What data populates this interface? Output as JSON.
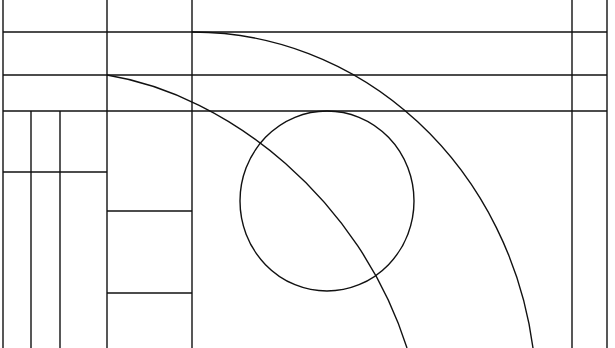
{
  "figure": {
    "size": {
      "width": 615,
      "height": 348
    },
    "stroke_color": "#111111",
    "background": "#ffffff",
    "vertical_lines": [
      {
        "x": 3,
        "y1": 0,
        "y2": 348
      },
      {
        "x": 107,
        "y1": 0,
        "y2": 348
      },
      {
        "x": 192,
        "y1": 0,
        "y2": 348
      },
      {
        "x": 572,
        "y1": 0,
        "y2": 348
      },
      {
        "x": 607,
        "y1": 0,
        "y2": 348
      },
      {
        "x": 31,
        "y1": 111,
        "y2": 348
      },
      {
        "x": 60,
        "y1": 111,
        "y2": 348
      }
    ],
    "horizontal_lines": [
      {
        "y": 32,
        "x1": 3,
        "x2": 607
      },
      {
        "y": 75,
        "x1": 3,
        "x2": 607
      },
      {
        "y": 111,
        "x1": 3,
        "x2": 607
      },
      {
        "y": 172,
        "x1": 3,
        "x2": 107
      },
      {
        "y": 211,
        "x1": 107,
        "x2": 192
      },
      {
        "y": 293,
        "x1": 107,
        "x2": 192
      }
    ],
    "circle": {
      "cx": 327,
      "cy": 201,
      "rx": 87,
      "ry": 90
    },
    "outer_arc": {
      "d": "M192,32 A344,368 0 0 1 533,348"
    },
    "inner_arc": {
      "d": "M107,75 C230,95 360,200 407,348"
    }
  }
}
